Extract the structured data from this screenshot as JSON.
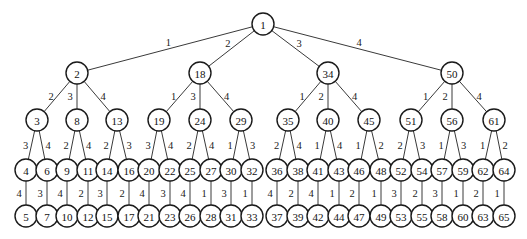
{
  "diagram": {
    "type": "tree",
    "root": {
      "id": 1,
      "children": [
        {
          "edge": 1,
          "id": 2,
          "children": [
            {
              "edge": 2,
              "id": 3,
              "children": [
                {
                  "edge": 3,
                  "id": 4,
                  "children": [
                    {
                      "edge": 4,
                      "id": 5,
                      "children": []
                    }
                  ]
                },
                {
                  "edge": 4,
                  "id": 6,
                  "children": [
                    {
                      "edge": 3,
                      "id": 7,
                      "children": []
                    }
                  ]
                }
              ]
            },
            {
              "edge": 3,
              "id": 8,
              "children": [
                {
                  "edge": 2,
                  "id": 9,
                  "children": [
                    {
                      "edge": 4,
                      "id": 10,
                      "children": []
                    }
                  ]
                },
                {
                  "edge": 4,
                  "id": 11,
                  "children": [
                    {
                      "edge": 2,
                      "id": 12,
                      "children": []
                    }
                  ]
                }
              ]
            },
            {
              "edge": 4,
              "id": 13,
              "children": [
                {
                  "edge": 2,
                  "id": 14,
                  "children": [
                    {
                      "edge": 3,
                      "id": 15,
                      "children": []
                    }
                  ]
                },
                {
                  "edge": 3,
                  "id": 16,
                  "children": [
                    {
                      "edge": 2,
                      "id": 17,
                      "children": []
                    }
                  ]
                }
              ]
            }
          ]
        },
        {
          "edge": 2,
          "id": 18,
          "children": [
            {
              "edge": 1,
              "id": 19,
              "children": [
                {
                  "edge": 3,
                  "id": 20,
                  "children": [
                    {
                      "edge": 4,
                      "id": 21,
                      "children": []
                    }
                  ]
                },
                {
                  "edge": 4,
                  "id": 22,
                  "children": [
                    {
                      "edge": 3,
                      "id": 23,
                      "children": []
                    }
                  ]
                }
              ]
            },
            {
              "edge": 3,
              "id": 24,
              "children": [
                {
                  "edge": 2,
                  "id": 25,
                  "children": [
                    {
                      "edge": 4,
                      "id": 26,
                      "children": []
                    }
                  ]
                },
                {
                  "edge": 4,
                  "id": 27,
                  "children": [
                    {
                      "edge": 1,
                      "id": 28,
                      "children": []
                    }
                  ]
                }
              ]
            },
            {
              "edge": 4,
              "id": 29,
              "children": [
                {
                  "edge": 1,
                  "id": 30,
                  "children": [
                    {
                      "edge": 3,
                      "id": 31,
                      "children": []
                    }
                  ]
                },
                {
                  "edge": 3,
                  "id": 32,
                  "children": [
                    {
                      "edge": 1,
                      "id": 33,
                      "children": []
                    }
                  ]
                }
              ]
            }
          ]
        },
        {
          "edge": 3,
          "id": 34,
          "children": [
            {
              "edge": 1,
              "id": 35,
              "children": [
                {
                  "edge": 2,
                  "id": 36,
                  "children": [
                    {
                      "edge": 4,
                      "id": 37,
                      "children": []
                    }
                  ]
                },
                {
                  "edge": 4,
                  "id": 38,
                  "children": [
                    {
                      "edge": 2,
                      "id": 39,
                      "children": []
                    }
                  ]
                }
              ]
            },
            {
              "edge": 2,
              "id": 40,
              "children": [
                {
                  "edge": 1,
                  "id": 41,
                  "children": [
                    {
                      "edge": 4,
                      "id": 42,
                      "children": []
                    }
                  ]
                },
                {
                  "edge": 4,
                  "id": 43,
                  "children": [
                    {
                      "edge": 1,
                      "id": 44,
                      "children": []
                    }
                  ]
                }
              ]
            },
            {
              "edge": 4,
              "id": 45,
              "children": [
                {
                  "edge": 1,
                  "id": 46,
                  "children": [
                    {
                      "edge": 2,
                      "id": 47,
                      "children": []
                    }
                  ]
                },
                {
                  "edge": 2,
                  "id": 48,
                  "children": [
                    {
                      "edge": 1,
                      "id": 49,
                      "children": []
                    }
                  ]
                }
              ]
            }
          ]
        },
        {
          "edge": 4,
          "id": 50,
          "children": [
            {
              "edge": 1,
              "id": 51,
              "children": [
                {
                  "edge": 2,
                  "id": 52,
                  "children": [
                    {
                      "edge": 3,
                      "id": 53,
                      "children": []
                    }
                  ]
                },
                {
                  "edge": 3,
                  "id": 54,
                  "children": [
                    {
                      "edge": 2,
                      "id": 55,
                      "children": []
                    }
                  ]
                }
              ]
            },
            {
              "edge": 2,
              "id": 56,
              "children": [
                {
                  "edge": 1,
                  "id": 57,
                  "children": [
                    {
                      "edge": 3,
                      "id": 58,
                      "children": []
                    }
                  ]
                },
                {
                  "edge": 3,
                  "id": 59,
                  "children": [
                    {
                      "edge": 1,
                      "id": 60,
                      "children": []
                    }
                  ]
                }
              ]
            },
            {
              "edge": 4,
              "id": 61,
              "children": [
                {
                  "edge": 1,
                  "id": 62,
                  "children": [
                    {
                      "edge": 2,
                      "id": 63,
                      "children": []
                    }
                  ]
                },
                {
                  "edge": 2,
                  "id": 64,
                  "children": [
                    {
                      "edge": 1,
                      "id": 65,
                      "children": []
                    }
                  ]
                }
              ]
            }
          ]
        }
      ]
    }
  }
}
